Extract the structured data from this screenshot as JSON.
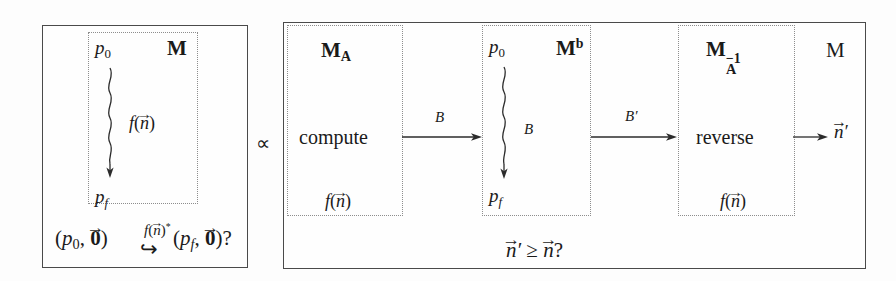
{
  "figure": {
    "relation_symbol": "∝",
    "left_panel": {
      "name": "left-panel",
      "machine_label": "M",
      "inner_box_label": "M",
      "start_state": "p",
      "start_state_sub": "0",
      "final_state": "p",
      "final_state_sub": "f",
      "run_label_f": "f",
      "run_label_arg_open": "(",
      "run_label_vec": "n",
      "run_label_arg_close": ")",
      "bottom_question": {
        "left_tuple_open": "(",
        "left_state": "p",
        "left_state_sub": "0",
        "comma": ", ",
        "zero_vec": "0",
        "left_tuple_close": ")",
        "arrow_glyph": "↪",
        "arrow_label_f": "f",
        "arrow_label_vec": "n",
        "arrow_label_star": "*",
        "right_state": "p",
        "right_state_sub": "f",
        "question_mark": "?"
      }
    },
    "right_panel": {
      "name": "right-panel",
      "boxes": [
        {
          "id": "box-MA",
          "header_base": "M",
          "header_sub": "A",
          "header_sup": "",
          "action_label": "compute",
          "fn_label_f": "f",
          "fn_label_vec": "n"
        },
        {
          "id": "box-Mb",
          "header_base": "M",
          "header_sub": "",
          "header_sup": "b",
          "start_state": "p",
          "start_state_sub": "0",
          "final_state": "p",
          "final_state_sub": "f",
          "squiggle_label": "B"
        },
        {
          "id": "box-MAinv",
          "header_base": "M",
          "header_sub": "A",
          "header_sup": "−1",
          "action_label": "reverse",
          "fn_label_f": "f",
          "fn_label_vec": "n"
        }
      ],
      "outer_machine_label": "M",
      "arrows": [
        {
          "id": "arrow-B",
          "label": "B"
        },
        {
          "id": "arrow-Bp",
          "label": "B′"
        },
        {
          "id": "arrow-out",
          "label": ""
        }
      ],
      "output_vector": "n",
      "output_prime": "′",
      "bottom_question": {
        "lhs_vec": "n",
        "lhs_prime": "′",
        "relation": "≥",
        "rhs_vec": "n",
        "question_mark": "?"
      }
    },
    "colors": {
      "ink": "#1a1a1a",
      "panel_border": "#4a4a4a",
      "dotted_border": "#8d8d8d",
      "background": "#fdfdfd"
    }
  }
}
